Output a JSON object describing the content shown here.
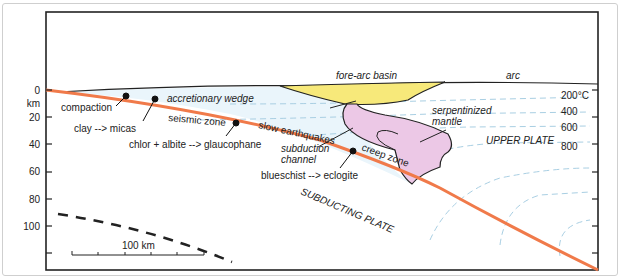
{
  "figure": {
    "type": "subduction-zone cross-section",
    "depth_axis": {
      "unit_label": "km",
      "ticks": [
        "0",
        "20",
        "40",
        "60",
        "80",
        "100"
      ]
    },
    "scale_bar": {
      "label": "100 km"
    },
    "isotherms": {
      "labels": [
        "200°C",
        "400",
        "600",
        "800"
      ]
    },
    "regions": {
      "fore_arc_basin": "fore-arc basin",
      "arc": "arc",
      "accretionary_wedge": "accretionary wedge",
      "serpentinized_mantle_line1": "serpentinized",
      "serpentinized_mantle_line2": "mantle",
      "upper_plate": "UPPER PLATE",
      "subducting_plate": "SUBDUCTING PLATE",
      "subduction_channel_line1": "subduction",
      "subduction_channel_line2": "channel"
    },
    "zones": {
      "seismic_zone": "seismic zone",
      "slow_earthquakes": "slow earthquakes",
      "creep_zone": "creep zone"
    },
    "reactions": {
      "compaction": "compaction",
      "clay_micas": "clay --> micas",
      "chlor_glaucophane": "chlor + albite --> glaucophane",
      "blueschist_eclogite": "blueschist --> eclogite"
    },
    "colors": {
      "slab_top": "#f07a4a",
      "fore_arc_basin_fill": "#f7e97a",
      "serpentinite_fill": "#ecc8e6",
      "wedge_fill": "#eaf5fb",
      "isotherm": "#a9cfe3",
      "frame": "#222222"
    }
  }
}
